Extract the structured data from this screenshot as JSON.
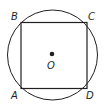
{
  "diagram": {
    "circle": {
      "center_label": "O",
      "cx": 52,
      "cy": 55,
      "r": 45
    },
    "square": {
      "vertices": [
        "A",
        "B",
        "C",
        "D"
      ]
    },
    "labels": {
      "A": "A",
      "B": "B",
      "C": "C",
      "D": "D",
      "O": "O"
    },
    "colors": {
      "stroke": "#231f20",
      "background": "#ffffff"
    }
  }
}
